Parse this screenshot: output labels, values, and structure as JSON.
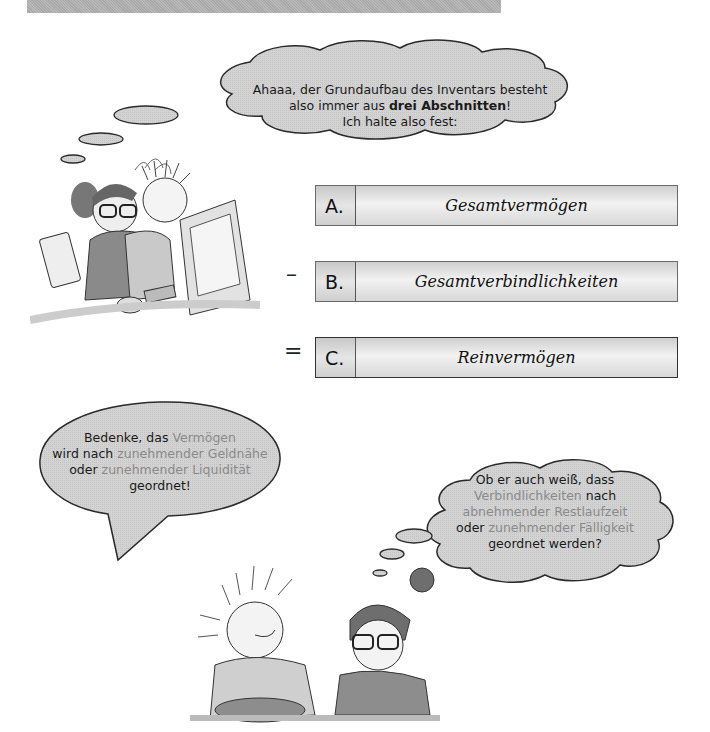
{
  "header": {
    "bar_color": "#b0b0b0"
  },
  "thought_top": {
    "line1": "Ahaaa, der Grundaufbau des Inventars besteht",
    "line2_prefix": "also immer aus ",
    "line2_bold": "drei Abschnitten",
    "line2_suffix": "!",
    "line3": "Ich halte also fest:"
  },
  "scheme": {
    "rows": [
      {
        "operator": "",
        "letter": "A.",
        "label": "Gesamtvermögen"
      },
      {
        "operator": "–",
        "letter": "B.",
        "label": "Gesamtverbindlichkeiten"
      },
      {
        "operator": "=",
        "letter": "C.",
        "label": "Reinvermögen"
      }
    ]
  },
  "speech_left": {
    "l1_prefix": "Bedenke, das ",
    "l1_hl": "Vermögen",
    "l2_prefix": "wird nach ",
    "l2_hl": "zunehmender Geldnähe",
    "l3_prefix": "oder ",
    "l3_hl": "zunehmender Liquidität",
    "l4": "geordnet!"
  },
  "thought_right": {
    "l1": "Ob er auch weiß, dass",
    "l2_hl": "Verbindlichkeiten",
    "l2_suffix": " nach",
    "l3_hl": "abnehmender Restlaufzeit",
    "l4_prefix": "oder ",
    "l4_hl": "zunehmender Fälligkeit",
    "l5": "geordnet werden?"
  },
  "colors": {
    "bubble_fill": "#d6d6d6",
    "highlight_text": "#8a8a8a",
    "outline": "#333333"
  }
}
